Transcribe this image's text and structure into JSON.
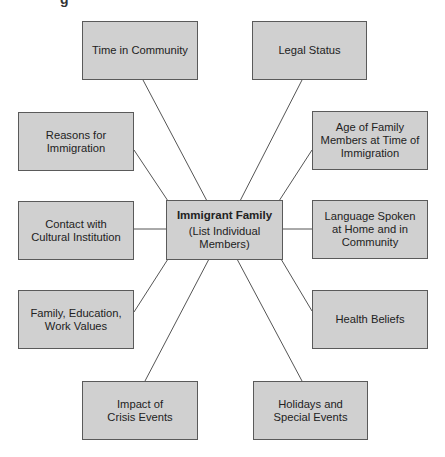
{
  "diagram": {
    "title_fragment": "g",
    "center": {
      "title": "Immigrant Family",
      "subtitle_lines": [
        "(List Individual",
        "Members)"
      ]
    },
    "nodes": [
      {
        "id": "time-in-community",
        "lines": [
          "Time in Community"
        ]
      },
      {
        "id": "legal-status",
        "lines": [
          "Legal Status"
        ]
      },
      {
        "id": "reasons-for-immigration",
        "lines": [
          "Reasons for",
          "Immigration"
        ]
      },
      {
        "id": "age-of-family-members",
        "lines": [
          "Age of Family",
          "Members at Time of",
          "Immigration"
        ]
      },
      {
        "id": "contact-with-cultural-institution",
        "lines": [
          "Contact with",
          "Cultural Institution"
        ]
      },
      {
        "id": "language-spoken",
        "lines": [
          "Language Spoken",
          "at Home and in",
          "Community"
        ]
      },
      {
        "id": "family-education-work-values",
        "lines": [
          "Family, Education,",
          "Work Values"
        ]
      },
      {
        "id": "health-beliefs",
        "lines": [
          "Health Beliefs"
        ]
      },
      {
        "id": "impact-of-crisis-events",
        "lines": [
          "Impact of",
          "Crisis Events"
        ]
      },
      {
        "id": "holidays-and-special-events",
        "lines": [
          "Holidays and",
          "Special Events"
        ]
      }
    ],
    "colors": {
      "box_fill": "#d0d0d0",
      "box_border": "#5a5a5a",
      "connector": "#555555",
      "text": "#222222"
    }
  }
}
